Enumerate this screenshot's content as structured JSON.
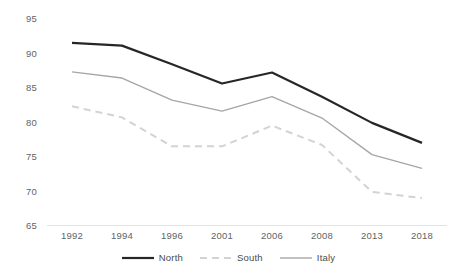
{
  "chart_data": {
    "type": "line",
    "title": "",
    "subtitle": "",
    "xlabel": "",
    "ylabel": "",
    "categories": [
      "1992",
      "1994",
      "1996",
      "2001",
      "2006",
      "2008",
      "2013",
      "2018"
    ],
    "ylim": [
      65,
      95
    ],
    "yticks": [
      65,
      70,
      75,
      80,
      85,
      90,
      95
    ],
    "ytick_labels": [
      "65",
      "70",
      "75",
      "80",
      "85",
      "90",
      "95"
    ],
    "grid": false,
    "legend_position": "bottom",
    "series": [
      {
        "name": "North",
        "values": [
          91.4,
          91.0,
          88.3,
          85.5,
          87.1,
          83.6,
          79.8,
          76.9
        ],
        "color": "#262626",
        "width": 2.2,
        "dash": "none"
      },
      {
        "name": "South",
        "values": [
          82.2,
          80.6,
          76.4,
          76.4,
          79.4,
          76.6,
          69.8,
          68.9
        ],
        "color": "#d3d3d3",
        "width": 2.0,
        "dash": "7,5"
      },
      {
        "name": "Italy",
        "values": [
          87.2,
          86.3,
          83.1,
          81.5,
          83.6,
          80.5,
          75.2,
          73.2
        ],
        "color": "#a6a6a6",
        "width": 1.4,
        "dash": "none"
      }
    ]
  },
  "axis": {
    "line_color": "#e3e3e3",
    "label_color": "#636363"
  }
}
